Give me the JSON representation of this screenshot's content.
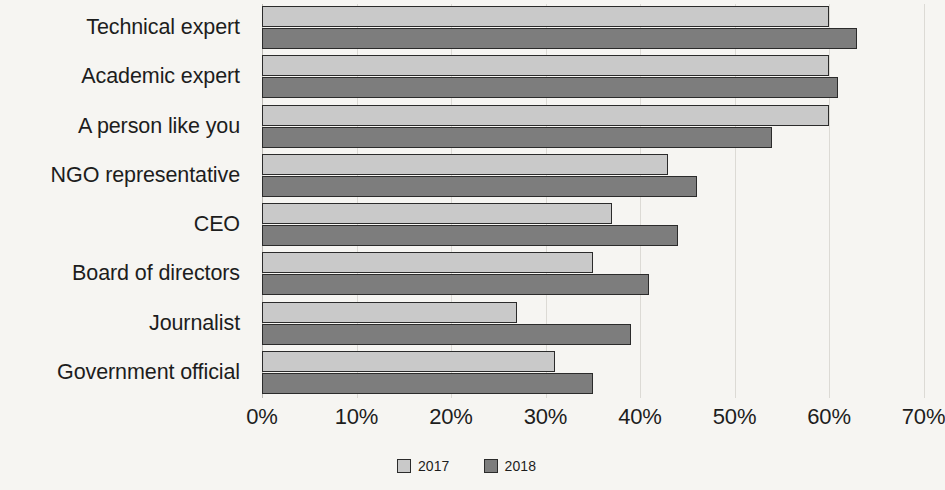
{
  "chart_data": {
    "type": "bar",
    "orientation": "horizontal",
    "title": "",
    "subtitle": "",
    "xlabel": "",
    "ylabel": "",
    "xlim": [
      0,
      70
    ],
    "xtick_labels": [
      "0%",
      "10%",
      "20%",
      "30%",
      "40%",
      "50%",
      "60%",
      "70%"
    ],
    "xticks": [
      0,
      10,
      20,
      30,
      40,
      50,
      60,
      70
    ],
    "grid": true,
    "grid_axis": "x",
    "legend_position": "bottom-center",
    "categories": [
      "Technical expert",
      "Academic expert",
      "A person like you",
      "NGO representative",
      "CEO",
      "Board of directors",
      "Journalist",
      "Government official"
    ],
    "series": [
      {
        "name": "2017",
        "color": "#c9c9c9",
        "values": [
          60,
          60,
          60,
          43,
          37,
          35,
          27,
          31
        ]
      },
      {
        "name": "2018",
        "color": "#7d7d7d",
        "values": [
          63,
          61,
          54,
          46,
          44,
          41,
          39,
          35
        ]
      }
    ]
  },
  "legend": {
    "items": [
      {
        "label": "2017",
        "swatch": "legend-swatch-2017"
      },
      {
        "label": "2018",
        "swatch": "legend-swatch-2018"
      }
    ]
  },
  "colors": {
    "background": "#f6f5f2",
    "series_2017": "#c9c9c9",
    "series_2018": "#7d7d7d",
    "bar_outline": "#2b2b2b",
    "gridline": "#dcdad5",
    "text": "#1d1d1d"
  }
}
